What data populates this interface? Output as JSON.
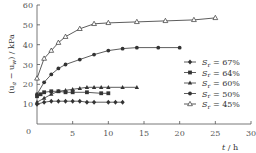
{
  "chart_data": {
    "type": "line",
    "title": "",
    "xlabel": "t / h",
    "ylabel": "(u_a − u_w) / kPa",
    "xlim": [
      0,
      30
    ],
    "ylim": [
      0,
      60
    ],
    "xticks": [
      0,
      5,
      10,
      15,
      20,
      25,
      30
    ],
    "yticks": [
      0,
      10,
      20,
      30,
      40,
      50,
      60
    ],
    "grid": false,
    "legend_position": "right-middle",
    "series": [
      {
        "name": "Sr = 67%",
        "marker": "diamond-filled",
        "x": [
          0,
          1,
          2,
          3,
          4,
          5,
          6,
          7,
          8,
          10,
          11,
          12
        ],
        "values": [
          10,
          11,
          11.5,
          11.5,
          11.5,
          11.5,
          11.5,
          11,
          11,
          11,
          11,
          11
        ]
      },
      {
        "name": "Sr = 64%",
        "marker": "square-filled",
        "x": [
          0,
          0.5,
          1,
          2,
          3,
          4,
          5,
          7,
          9,
          10
        ],
        "values": [
          14,
          15,
          16,
          16.5,
          16.5,
          16,
          16,
          16,
          15.5,
          15.5
        ]
      },
      {
        "name": "Sr = 60%",
        "marker": "triangle-filled",
        "x": [
          0,
          1,
          2,
          3,
          4,
          5,
          6,
          7,
          8,
          9,
          10,
          12,
          14
        ],
        "values": [
          11,
          13,
          15,
          16.5,
          17,
          17.5,
          18,
          18.5,
          18.5,
          18.5,
          18.5,
          18.5,
          18.5
        ]
      },
      {
        "name": "Sr = 50%",
        "marker": "circle-filled",
        "x": [
          0,
          1,
          2,
          3,
          4,
          6,
          8,
          10,
          12,
          14,
          17,
          20
        ],
        "values": [
          15,
          21,
          25,
          28,
          30,
          32.5,
          35,
          37,
          38,
          38.5,
          38.5,
          38.5
        ]
      },
      {
        "name": "Sr = 45%",
        "marker": "triangle-open",
        "x": [
          0,
          1,
          2,
          3,
          4,
          6,
          8,
          10,
          14,
          18,
          22,
          25
        ],
        "values": [
          23,
          33,
          37,
          41,
          44,
          48,
          50.5,
          51,
          51.5,
          52,
          52.5,
          53.5
        ]
      }
    ]
  },
  "axes": {
    "y_title_main": "(u",
    "y_sub_a": "a",
    "y_mid": " − u",
    "y_sub_w": "w",
    "y_tail": ") / kPa",
    "x_title_t": "t",
    "x_title_unit": " / h",
    "x_tick_labels": [
      "0",
      "5",
      "10",
      "15",
      "20",
      "25",
      "30"
    ],
    "y_tick_labels": [
      "10",
      "20",
      "30",
      "40",
      "50",
      "60"
    ]
  },
  "legend": [
    {
      "symbol": "S",
      "sub": "r",
      "text": " = 67%"
    },
    {
      "symbol": "S",
      "sub": "r",
      "text": " = 64%"
    },
    {
      "symbol": "S",
      "sub": "r",
      "text": " = 60%"
    },
    {
      "symbol": "S",
      "sub": "r",
      "text": " = 50%"
    },
    {
      "symbol": "S",
      "sub": "r",
      "text": " = 45%"
    }
  ],
  "colors": {
    "line": "#333333",
    "axis": "#555555"
  }
}
